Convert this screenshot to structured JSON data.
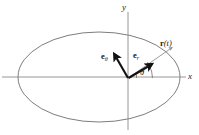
{
  "figure": {
    "kind": "polar-unit-vector-diagram",
    "background_color": "#ffffff",
    "canvas": {
      "width": 199,
      "height": 135
    }
  },
  "axes": {
    "x_label": "x",
    "y_label": "y",
    "axis_color": "#808080",
    "origin": {
      "x": 128,
      "y": 78
    },
    "x_axis": {
      "x1": 2,
      "y1": 77,
      "x2": 186,
      "y2": 77
    },
    "y_axis": {
      "x1": 128,
      "y1": 12,
      "x2": 128,
      "y2": 130
    }
  },
  "orbit": {
    "name": "ellipse-path",
    "stroke_color": "#6e6e6e",
    "center": {
      "x": 99,
      "y": 77
    },
    "radius_x": 81,
    "radius_y": 45
  },
  "vectors": [
    {
      "name": "e-theta",
      "label_bold": "e",
      "label_sub": "θ",
      "label_arg": "",
      "color": "#111111",
      "from": {
        "x": 128,
        "y": 78
      },
      "to": {
        "x": 114,
        "y": 54
      },
      "style": "bold"
    },
    {
      "name": "e-r",
      "label_bold": "e",
      "label_sub": "r",
      "label_arg": "",
      "color": "#111111",
      "from": {
        "x": 128,
        "y": 78
      },
      "to": {
        "x": 152,
        "y": 64
      },
      "style": "bold"
    },
    {
      "name": "r-of-t",
      "label_bold": "r",
      "label_sub": "",
      "label_arg": "(t)",
      "color": "#8a8a8a",
      "from": {
        "x": 128,
        "y": 78
      },
      "to": {
        "x": 173,
        "y": 47
      },
      "style": "thin"
    }
  ],
  "angle": {
    "name": "theta",
    "symbol": "θ",
    "vertex": {
      "x": 128,
      "y": 78
    },
    "start_deg": 0,
    "end_deg": 34,
    "arc_radius": 24,
    "color": "#6e6e6e"
  },
  "labels": {
    "y_axis": "y",
    "x_axis": "x",
    "e_theta_base": "e",
    "e_theta_sub": "θ",
    "e_r_base": "e",
    "e_r_sub": "r",
    "r_base": "r",
    "r_arg": "(t)",
    "theta": "θ"
  }
}
